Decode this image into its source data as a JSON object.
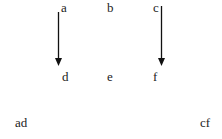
{
  "top_row": [
    "a",
    "b",
    "c"
  ],
  "middle_row": [
    "d",
    "e",
    "f"
  ],
  "bottom_row": {
    "left": "ad",
    "right": "cf"
  },
  "arrows": [
    {
      "from": "a",
      "to": "d"
    },
    {
      "from": "c",
      "to": "f"
    }
  ],
  "colors": {
    "arrow": "#111111",
    "text": "#222222"
  }
}
